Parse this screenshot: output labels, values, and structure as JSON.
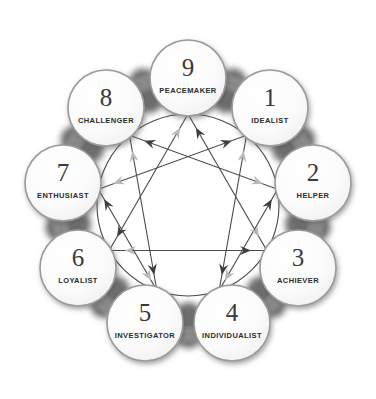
{
  "diagram": {
    "type": "enneagram-personality-diagram",
    "background_color": "#ffffff",
    "center": {
      "x": 188,
      "y": 205
    },
    "outer_ring_radius": 127,
    "inner_circle_radius": 91,
    "node_circle_radius": 38,
    "colors": {
      "line_stroke": "#4a4a4a",
      "circle_outline": "#9a9a9a",
      "node_fill": "#fbfbfb",
      "shadow_dark": "#555555",
      "shadow_mid": "#8d8d8d",
      "arrow_dark": "#3d3d3d",
      "arrow_light": "#b9b9b9",
      "number_color": "#3a3a3a",
      "label_color": "#2b2b2b"
    },
    "nodes": [
      {
        "id": "9",
        "number": "9",
        "label": "PEACEMAKER",
        "angle_deg": -90,
        "cx": 188,
        "cy": 78,
        "number_size": 25,
        "label_size": 7.5
      },
      {
        "id": "1",
        "number": "1",
        "label": "IDEALIST",
        "angle_deg": -50,
        "cx": 270,
        "cy": 108,
        "number_size": 25,
        "label_size": 7.5
      },
      {
        "id": "2",
        "number": "2",
        "label": "HELPER",
        "angle_deg": -10,
        "cx": 313,
        "cy": 183,
        "number_size": 25,
        "label_size": 7.5
      },
      {
        "id": "3",
        "number": "3",
        "label": "ACHIEVER",
        "angle_deg": 30,
        "cx": 298,
        "cy": 268,
        "number_size": 25,
        "label_size": 7.5
      },
      {
        "id": "4",
        "number": "4",
        "label": "INDIVIDUALIST",
        "angle_deg": 70,
        "cx": 232,
        "cy": 323,
        "number_size": 25,
        "label_size": 7.5
      },
      {
        "id": "5",
        "number": "5",
        "label": "INVESTIGATOR",
        "angle_deg": 110,
        "cx": 145,
        "cy": 323,
        "number_size": 25,
        "label_size": 7.5
      },
      {
        "id": "6",
        "number": "6",
        "label": "LOYALIST",
        "angle_deg": 150,
        "cx": 78,
        "cy": 268,
        "number_size": 25,
        "label_size": 7.5
      },
      {
        "id": "7",
        "number": "7",
        "label": "ENTHUSIAST",
        "angle_deg": 190,
        "cx": 63,
        "cy": 183,
        "number_size": 25,
        "label_size": 7.5
      },
      {
        "id": "8",
        "number": "8",
        "label": "CHALLENGER",
        "angle_deg": 230,
        "cx": 106,
        "cy": 108,
        "number_size": 25,
        "label_size": 7.5
      }
    ],
    "inner_triangle": {
      "name": "triangle-9-3-6",
      "sequence": [
        "9",
        "3",
        "6"
      ]
    },
    "inner_hexad": {
      "name": "hexad-1-4-2-8-5-7",
      "sequence": [
        "1",
        "4",
        "2",
        "8",
        "5",
        "7"
      ]
    },
    "arrow_directions": {
      "dark_arrows": "integration/disintegration markers rendered in dark gray",
      "light_arrows": "counter-direction markers rendered in light gray"
    }
  }
}
